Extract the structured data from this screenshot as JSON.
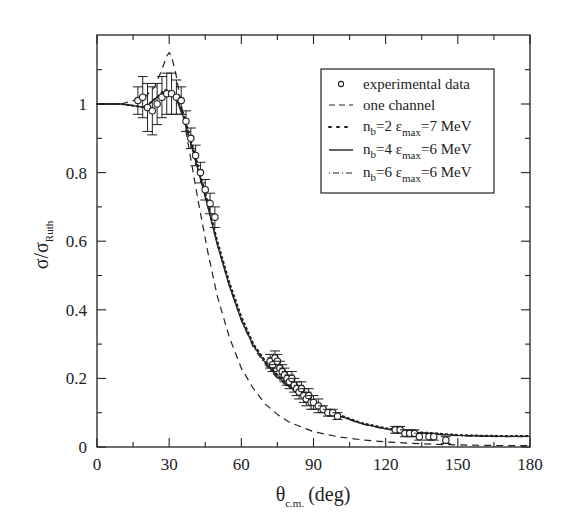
{
  "chart_data": {
    "type": "line",
    "title": "",
    "xlabel": "θ_c.m. (deg)",
    "xlabel_main": "θ",
    "xlabel_sub": "c.m.",
    "xlabel_unit": "(deg)",
    "ylabel": "σ/σ_Ruth",
    "ylabel_main": "σ/σ",
    "ylabel_sub": "Ruth",
    "xlim": [
      0,
      180
    ],
    "ylim": [
      0,
      1.15
    ],
    "x_ticks": [
      "0",
      "30",
      "60",
      "90",
      "120",
      "150",
      "180"
    ],
    "y_ticks": [
      "0",
      "0.2",
      "0.4",
      "0.6",
      "0.8",
      "1"
    ],
    "grid": false,
    "legend_position": "upper right",
    "legend": [
      {
        "label": "experimental data",
        "style": "open-circle"
      },
      {
        "label": "one channel",
        "style": "dashed"
      },
      {
        "label_main": "n",
        "label_sub": "b",
        "label_mid": "=2 ε",
        "label_sub2": "max",
        "label_end": "=7 MeV",
        "label": "n_b=2 ε_max=7 MeV",
        "style": "dotted"
      },
      {
        "label_main": "n",
        "label_sub": "b",
        "label_mid": "=4 ε",
        "label_sub2": "max",
        "label_end": "=6 MeV",
        "label": "n_b=4 ε_max=6 MeV",
        "style": "solid"
      },
      {
        "label_main": "n",
        "label_sub": "b",
        "label_mid": "=6 ε",
        "label_sub2": "max",
        "label_end": "=6 MeV",
        "label": "n_b=6 ε_max=6 MeV",
        "style": "dash-dot"
      }
    ],
    "series": [
      {
        "name": "experimental data",
        "type": "scatter",
        "x": [
          17,
          19,
          21,
          23,
          25,
          27,
          29,
          31,
          33,
          35,
          37,
          39,
          41,
          43,
          45,
          47,
          49,
          72,
          73,
          74,
          75,
          76,
          77,
          78,
          79,
          80,
          81,
          82,
          83,
          84,
          85,
          86,
          87,
          88,
          89,
          90,
          92,
          94,
          96,
          98,
          100,
          124,
          126,
          128,
          130,
          132,
          134,
          138,
          140,
          145
        ],
        "y": [
          1.01,
          1.02,
          0.99,
          0.98,
          1.0,
          1.02,
          1.03,
          1.03,
          1.02,
          1.01,
          0.95,
          0.9,
          0.85,
          0.8,
          0.75,
          0.71,
          0.67,
          0.25,
          0.24,
          0.26,
          0.25,
          0.23,
          0.22,
          0.21,
          0.2,
          0.19,
          0.2,
          0.18,
          0.17,
          0.16,
          0.17,
          0.15,
          0.14,
          0.15,
          0.13,
          0.13,
          0.12,
          0.11,
          0.1,
          0.1,
          0.09,
          0.05,
          0.05,
          0.04,
          0.04,
          0.04,
          0.03,
          0.03,
          0.03,
          0.02
        ],
        "yerr": [
          0.04,
          0.06,
          0.07,
          0.07,
          0.06,
          0.06,
          0.06,
          0.06,
          0.05,
          0.04,
          0.03,
          0.03,
          0.03,
          0.03,
          0.03,
          0.03,
          0.03,
          0.02,
          0.02,
          0.02,
          0.02,
          0.02,
          0.02,
          0.02,
          0.02,
          0.02,
          0.02,
          0.02,
          0.02,
          0.02,
          0.02,
          0.02,
          0.02,
          0.02,
          0.02,
          0.02,
          0.02,
          0.01,
          0.01,
          0.01,
          0.01,
          0.01,
          0.01,
          0.01,
          0.01,
          0.01,
          0.01,
          0.01,
          0.01,
          0.01
        ]
      },
      {
        "name": "one channel",
        "x": [
          0,
          10,
          15,
          20,
          24,
          27,
          29,
          30,
          31,
          33,
          35,
          38,
          42,
          46,
          50,
          55,
          60,
          65,
          70,
          75,
          80,
          90,
          100,
          110,
          120,
          130,
          140,
          150,
          160,
          170,
          180
        ],
        "y": [
          1.0,
          1.0,
          1.01,
          1.02,
          1.05,
          1.1,
          1.14,
          1.15,
          1.14,
          1.08,
          1.0,
          0.88,
          0.72,
          0.57,
          0.44,
          0.32,
          0.23,
          0.17,
          0.125,
          0.095,
          0.072,
          0.045,
          0.03,
          0.021,
          0.015,
          0.011,
          0.008,
          0.006,
          0.005,
          0.004,
          0.004
        ]
      },
      {
        "name": "n_b=2 ε_max=7 MeV",
        "x": [
          0,
          10,
          15,
          20,
          25,
          28,
          30,
          33,
          36,
          40,
          45,
          50,
          55,
          60,
          65,
          70,
          75,
          80,
          90,
          100,
          110,
          120,
          130,
          140,
          150,
          160,
          170,
          180
        ],
        "y": [
          1.0,
          1.0,
          0.995,
          0.99,
          1.02,
          1.04,
          1.04,
          1.02,
          0.97,
          0.87,
          0.74,
          0.6,
          0.48,
          0.38,
          0.3,
          0.25,
          0.21,
          0.18,
          0.13,
          0.095,
          0.07,
          0.055,
          0.045,
          0.04,
          0.035,
          0.033,
          0.032,
          0.032
        ]
      },
      {
        "name": "n_b=4 ε_max=6 MeV",
        "x": [
          0,
          10,
          15,
          20,
          25,
          28,
          30,
          33,
          36,
          40,
          45,
          50,
          55,
          60,
          65,
          70,
          75,
          80,
          90,
          100,
          110,
          120,
          130,
          140,
          150,
          160,
          170,
          180
        ],
        "y": [
          1.0,
          1.0,
          0.995,
          0.99,
          1.02,
          1.035,
          1.035,
          1.015,
          0.96,
          0.86,
          0.73,
          0.59,
          0.47,
          0.37,
          0.295,
          0.245,
          0.205,
          0.175,
          0.128,
          0.093,
          0.068,
          0.053,
          0.044,
          0.038,
          0.034,
          0.032,
          0.031,
          0.031
        ]
      },
      {
        "name": "n_b=6 ε_max=6 MeV",
        "x": [
          0,
          10,
          15,
          20,
          25,
          28,
          30,
          33,
          36,
          40,
          45,
          50,
          55,
          60,
          65,
          70,
          75,
          80,
          90,
          100,
          110,
          120,
          130,
          140,
          150,
          160,
          170,
          180
        ],
        "y": [
          1.0,
          1.0,
          0.995,
          0.99,
          1.02,
          1.035,
          1.035,
          1.015,
          0.96,
          0.86,
          0.73,
          0.59,
          0.47,
          0.37,
          0.29,
          0.24,
          0.2,
          0.172,
          0.126,
          0.091,
          0.067,
          0.052,
          0.043,
          0.037,
          0.033,
          0.031,
          0.03,
          0.03
        ]
      }
    ]
  },
  "colors": {
    "ink": "#222222",
    "background": "#ffffff"
  }
}
